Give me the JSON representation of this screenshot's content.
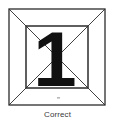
{
  "figure": {
    "caption": "Correct",
    "digit_label": "1",
    "colors": {
      "stroke": "#2b2b2b",
      "digit_fill": "#111111",
      "background": "#ffffff",
      "caption_text": "#3a3a3a",
      "faint_mark": "#b8b8b8"
    },
    "outer_square": {
      "name": "outer-square",
      "x": 9,
      "y": 9,
      "width": 96,
      "height": 96,
      "stroke_width": 1.3
    },
    "inner_square": {
      "name": "inner-square",
      "x": 26,
      "y": 26,
      "width": 62,
      "height": 62,
      "stroke_width": 1.3
    },
    "perspective_edges": [
      {
        "name": "edge-top-left",
        "x1": 9,
        "y1": 9,
        "x2": 26,
        "y2": 26
      },
      {
        "name": "edge-top-right",
        "x1": 105,
        "y1": 9,
        "x2": 88,
        "y2": 26
      },
      {
        "name": "edge-bottom-left",
        "x1": 9,
        "y1": 105,
        "x2": 26,
        "y2": 88
      },
      {
        "name": "edge-bottom-right",
        "x1": 105,
        "y1": 105,
        "x2": 88,
        "y2": 88
      }
    ],
    "inner_diagonals": [
      {
        "name": "diagonal-down-right",
        "x1": 26,
        "y1": 26,
        "x2": 88,
        "y2": 88
      },
      {
        "name": "diagonal-up-right",
        "x1": 26,
        "y1": 88,
        "x2": 88,
        "y2": 26
      }
    ],
    "digit_glyph": {
      "name": "digit-one",
      "left": 40,
      "top": 25,
      "width": 30,
      "height": 62,
      "font_size": 76
    },
    "faint_mark": {
      "name": "faint-registration-mark",
      "x": 57,
      "y": 97,
      "width": 3,
      "height": 2
    }
  }
}
